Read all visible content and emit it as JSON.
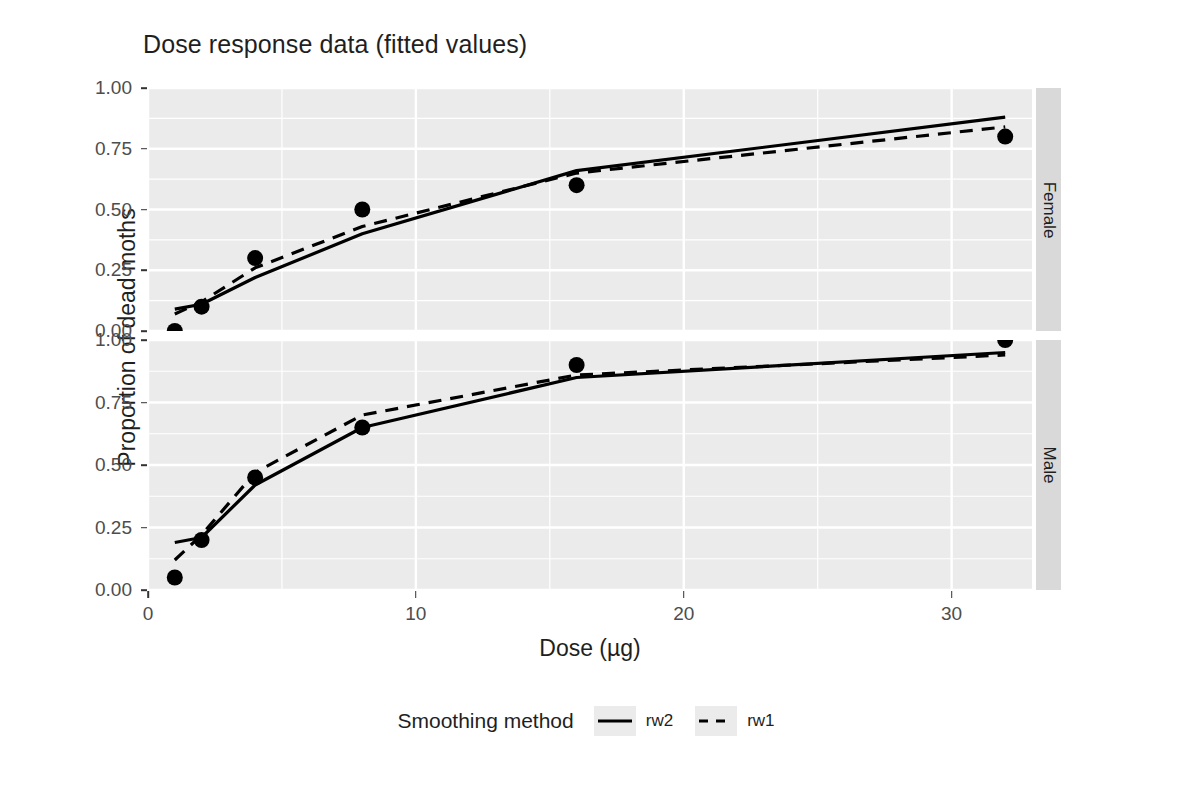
{
  "chart_data": {
    "type": "line",
    "title": "Dose response data (fitted values)",
    "xlabel": "Dose (µg)",
    "ylabel": "Proportion of dead moths",
    "xlim": [
      0,
      33
    ],
    "ylim": [
      0.0,
      1.0
    ],
    "grid": true,
    "x_ticks": [
      "0",
      "10",
      "20",
      "30"
    ],
    "x_tick_values": [
      0,
      10,
      20,
      30
    ],
    "y_ticks": [
      "0.00",
      "0.25",
      "0.50",
      "0.75",
      "1.00"
    ],
    "y_tick_values": [
      0.0,
      0.25,
      0.5,
      0.75,
      1.0
    ],
    "legend_title": "Smoothing method",
    "legend_position": "bottom",
    "legend_entries": [
      {
        "name": "rw2",
        "style": "solid"
      },
      {
        "name": "rw1",
        "style": "dashed"
      }
    ],
    "facets": [
      {
        "label": "Female",
        "x": [
          1,
          2,
          4,
          8,
          16,
          32
        ],
        "points": [
          0.0,
          0.1,
          0.3,
          0.5,
          0.6,
          0.8
        ],
        "series": [
          {
            "name": "rw2",
            "style": "solid",
            "values": [
              0.09,
              0.11,
              0.22,
              0.4,
              0.66,
              0.88
            ]
          },
          {
            "name": "rw1",
            "style": "dashed",
            "values": [
              0.07,
              0.12,
              0.26,
              0.43,
              0.65,
              0.84
            ]
          }
        ]
      },
      {
        "label": "Male",
        "x": [
          1,
          2,
          4,
          8,
          16,
          32
        ],
        "points": [
          0.05,
          0.2,
          0.45,
          0.65,
          0.9,
          1.0
        ],
        "series": [
          {
            "name": "rw2",
            "style": "solid",
            "values": [
              0.19,
              0.21,
              0.42,
              0.65,
              0.85,
              0.95
            ]
          },
          {
            "name": "rw1",
            "style": "dashed",
            "values": [
              0.12,
              0.22,
              0.47,
              0.7,
              0.86,
              0.94
            ]
          }
        ]
      }
    ],
    "colors": {
      "panel_background": "#ebebeb",
      "grid": "#ffffff",
      "strip_background": "#d9d9d9",
      "line": "#000000",
      "point": "#000000",
      "text": "#1f1f1f",
      "tick_text": "#4d4d4d"
    }
  }
}
